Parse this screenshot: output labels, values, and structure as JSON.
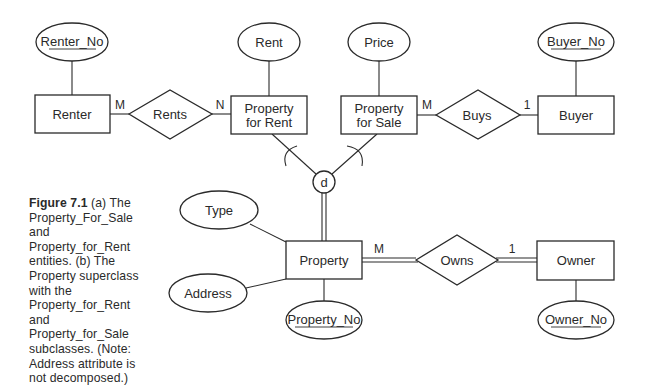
{
  "diagram": {
    "type": "EER diagram",
    "entities": [
      {
        "id": "renter",
        "label": "Renter"
      },
      {
        "id": "property_for_rent",
        "label": "Property\nfor Rent"
      },
      {
        "id": "property_for_sale",
        "label": "Property\nfor Sale"
      },
      {
        "id": "buyer",
        "label": "Buyer"
      },
      {
        "id": "property",
        "label": "Property"
      },
      {
        "id": "owner",
        "label": "Owner"
      }
    ],
    "relationships": [
      {
        "id": "rents",
        "label": "Rents",
        "left": "renter",
        "right": "property_for_rent",
        "left_card": "M",
        "right_card": "N"
      },
      {
        "id": "buys",
        "label": "Buys",
        "left": "property_for_sale",
        "right": "buyer",
        "left_card": "M",
        "right_card": "1"
      },
      {
        "id": "owns",
        "label": "Owns",
        "left": "property",
        "right": "owner",
        "left_card": "M",
        "right_card": "1",
        "participation": "total"
      }
    ],
    "attributes": [
      {
        "id": "renter_no",
        "label": "Renter_No",
        "of": "renter",
        "key": true
      },
      {
        "id": "rent",
        "label": "Rent",
        "of": "property_for_rent",
        "key": false
      },
      {
        "id": "price",
        "label": "Price",
        "of": "property_for_sale",
        "key": false
      },
      {
        "id": "buyer_no",
        "label": "Buyer_No",
        "of": "buyer",
        "key": true
      },
      {
        "id": "type",
        "label": "Type",
        "of": "property",
        "key": false
      },
      {
        "id": "address",
        "label": "Address",
        "of": "property",
        "key": false
      },
      {
        "id": "property_no",
        "label": "Property_No",
        "of": "property",
        "key": true
      },
      {
        "id": "owner_no",
        "label": "Owner_No",
        "of": "owner",
        "key": true
      }
    ],
    "specialization": {
      "symbol": "d",
      "superclass": "property",
      "subclasses": [
        "property_for_rent",
        "property_for_sale"
      ],
      "participation": "total"
    }
  },
  "caption": {
    "figure_label": "Figure 7.1",
    "text": " (a)  The Property_For_Sale and Property_for_Rent entities. (b) The Property superclass with the Property_for_Rent and Property_for_Sale subclasses. (Note: Address attribute is not decomposed.)"
  }
}
